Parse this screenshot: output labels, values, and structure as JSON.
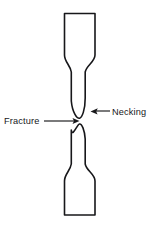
{
  "figure": {
    "background_color": "#ffffff",
    "line_color": "#17171a",
    "width": 151,
    "height": 233
  },
  "labels": {
    "fracture": {
      "text": "Fracture",
      "x": 4,
      "y": 124,
      "anchor": "start"
    },
    "necking": {
      "text": "Necking",
      "x": 112,
      "y": 115,
      "anchor": "start"
    }
  },
  "leaders": {
    "fracture_line": {
      "name": "fracture-leader",
      "from_x": 44,
      "from_y": 121,
      "to_x": 79,
      "to_y": 121,
      "arrow_direction": "right"
    },
    "necking_line": {
      "name": "necking-leader",
      "from_x": 110,
      "from_y": 111,
      "to_x": 91,
      "to_y": 111,
      "arrow_direction": "left"
    }
  },
  "geometry": {
    "upper_piece": {
      "name": "upper-specimen-half",
      "path": "M 64.5 13.5 L 95.0 13.5 L 95.0 55.0 C 95.0 62.0 86.5 65.0 85.2 72.0 L 85.2 98.0 C 85.2 110.0 82.0 117.6 79.6 118.2 C 77.2 118.8 72.4 113.0 71.3 101.0 L 71.3 72.0 C 70.2 65.0 64.5 62.0 64.5 55.0 Z"
    },
    "lower_piece": {
      "name": "lower-specimen-half",
      "path": "M 71.3 130.0 C 72.4 138.0 77.0 124.6 79.4 124.0 C 81.8 123.4 84.6 130.0 85.2 139.0 L 85.2 164.0 C 86.5 171.0 95.0 174.0 95.0 181.0 L 95.0 215.0 L 64.5 215.0 L 64.5 181.0 C 64.5 174.0 70.2 171.0 71.3 164.0 Z"
    }
  },
  "colors": {
    "ink": "#17171a",
    "paper": "#ffffff"
  }
}
